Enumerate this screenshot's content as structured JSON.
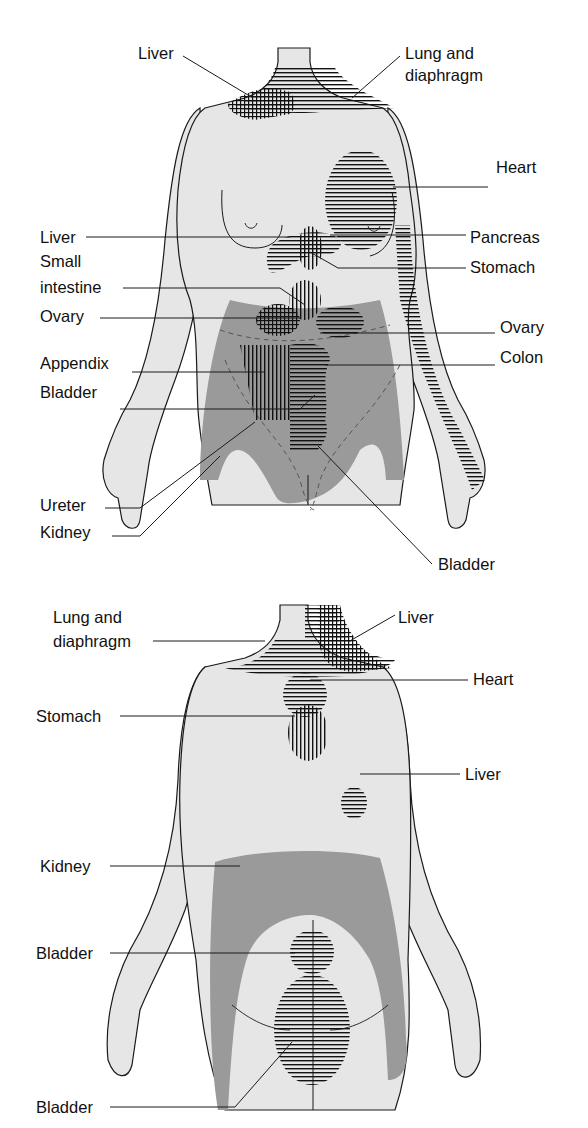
{
  "figure": {
    "colors": {
      "background": "#ffffff",
      "body_fill": "#e6e6e6",
      "kidney_shade": "#9a9a9a",
      "outline": "#1a1a1a",
      "hatch": "#111111"
    }
  },
  "anterior": {
    "view": "Front view",
    "labels": [
      {
        "id": "liver-neck",
        "text": "Liver"
      },
      {
        "id": "lung-diaphragm-1",
        "text": "Lung and"
      },
      {
        "id": "lung-diaphragm-2",
        "text": "diaphragm"
      },
      {
        "id": "heart",
        "text": "Heart"
      },
      {
        "id": "liver",
        "text": "Liver"
      },
      {
        "id": "pancreas",
        "text": "Pancreas"
      },
      {
        "id": "small-intestine-1",
        "text": "Small"
      },
      {
        "id": "small-intestine-2",
        "text": "intestine"
      },
      {
        "id": "stomach",
        "text": "Stomach"
      },
      {
        "id": "ovary-left",
        "text": "Ovary"
      },
      {
        "id": "ovary-right",
        "text": "Ovary"
      },
      {
        "id": "appendix",
        "text": "Appendix"
      },
      {
        "id": "colon",
        "text": "Colon"
      },
      {
        "id": "bladder-1",
        "text": "Bladder"
      },
      {
        "id": "ureter",
        "text": "Ureter"
      },
      {
        "id": "kidney",
        "text": "Kidney"
      },
      {
        "id": "bladder-2",
        "text": "Bladder"
      }
    ]
  },
  "posterior": {
    "view": "Back view",
    "labels": [
      {
        "id": "lung-diaphragm-1",
        "text": "Lung and"
      },
      {
        "id": "lung-diaphragm-2",
        "text": "diaphragm"
      },
      {
        "id": "liver-neck",
        "text": "Liver"
      },
      {
        "id": "heart",
        "text": "Heart"
      },
      {
        "id": "stomach",
        "text": "Stomach"
      },
      {
        "id": "liver",
        "text": "Liver"
      },
      {
        "id": "kidney",
        "text": "Kidney"
      },
      {
        "id": "bladder-1",
        "text": "Bladder"
      },
      {
        "id": "bladder-2",
        "text": "Bladder"
      }
    ]
  }
}
